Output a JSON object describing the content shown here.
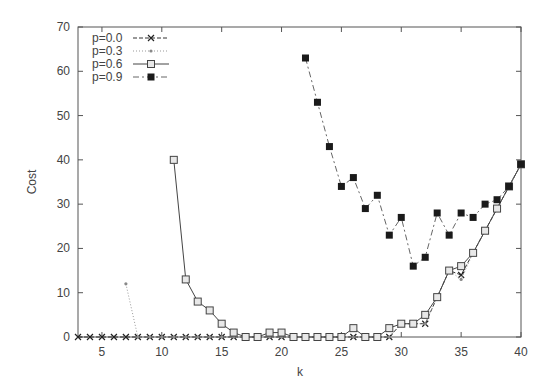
{
  "chart_data": {
    "type": "line",
    "title": "",
    "xlabel": "k",
    "ylabel": "Cost",
    "xlim": [
      3,
      40
    ],
    "ylim": [
      0,
      70
    ],
    "xticks": [
      5,
      10,
      15,
      20,
      25,
      30,
      35,
      40
    ],
    "yticks": [
      0,
      10,
      20,
      30,
      40,
      50,
      60,
      70
    ],
    "grid": false,
    "legend_position": "top-left",
    "series": [
      {
        "name": "p=0.0",
        "marker": "x",
        "line": "dashed",
        "x": [
          3,
          4,
          5,
          6,
          7,
          8,
          9,
          10,
          11,
          12,
          13,
          14,
          15,
          16,
          17,
          18,
          19,
          20,
          21,
          22,
          23,
          24,
          25,
          26,
          27,
          28,
          29,
          30,
          31,
          32,
          33,
          34,
          35,
          36,
          37,
          38,
          39,
          40
        ],
        "values": [
          0,
          0,
          0,
          0,
          0,
          0,
          0,
          0,
          0,
          0,
          0,
          0,
          0,
          0,
          0,
          0,
          0,
          0,
          0,
          0,
          0,
          0,
          0,
          0,
          0,
          0,
          0,
          3,
          3,
          3,
          9,
          15,
          14,
          19,
          24,
          29,
          34,
          39
        ]
      },
      {
        "name": "p=0.3",
        "marker": "star",
        "line": "dotted",
        "x": [
          7,
          8,
          9,
          10,
          11,
          12,
          13,
          14,
          15,
          16,
          17,
          18,
          19,
          20,
          21,
          22,
          23,
          24,
          25,
          26,
          27,
          28,
          29,
          30,
          31,
          32,
          33,
          34,
          35,
          36,
          37,
          38,
          39,
          40
        ],
        "values": [
          12,
          0,
          0,
          0,
          0,
          0,
          0,
          0,
          0,
          0,
          0,
          0,
          0,
          0,
          0,
          0,
          0,
          0,
          0,
          0,
          0,
          0,
          0,
          3,
          3,
          3,
          9,
          15,
          13,
          19,
          24,
          29,
          34,
          39
        ]
      },
      {
        "name": "p=0.6",
        "marker": "open-square",
        "line": "solid",
        "x": [
          11,
          12,
          13,
          14,
          15,
          16,
          17,
          18,
          19,
          20,
          21,
          22,
          23,
          24,
          25,
          26,
          27,
          28,
          29,
          30,
          31,
          32,
          33,
          34,
          35,
          36,
          37,
          38,
          39,
          40
        ],
        "values": [
          40,
          13,
          8,
          6,
          3,
          1,
          0,
          0,
          1,
          1,
          0,
          0,
          0,
          0,
          0,
          2,
          0,
          0,
          2,
          3,
          3,
          5,
          9,
          15,
          16,
          19,
          24,
          29,
          34,
          39
        ]
      },
      {
        "name": "p=0.9",
        "marker": "filled-square",
        "line": "dash-dot",
        "x": [
          22,
          23,
          24,
          25,
          26,
          27,
          28,
          29,
          30,
          31,
          32,
          33,
          34,
          35,
          36,
          37,
          38,
          39,
          40
        ],
        "values": [
          63,
          53,
          43,
          34,
          36,
          29,
          32,
          23,
          27,
          16,
          18,
          28,
          23,
          28,
          27,
          30,
          31,
          34,
          39
        ]
      }
    ]
  }
}
